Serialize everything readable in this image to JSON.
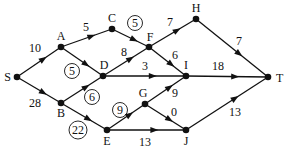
{
  "nodes": [
    {
      "id": "S",
      "label": "S"
    },
    {
      "id": "A",
      "label": "A"
    },
    {
      "id": "B",
      "label": "B"
    },
    {
      "id": "C",
      "label": "C"
    },
    {
      "id": "D",
      "label": "D"
    },
    {
      "id": "E",
      "label": "E"
    },
    {
      "id": "F",
      "label": "F"
    },
    {
      "id": "G",
      "label": "G"
    },
    {
      "id": "H",
      "label": "H"
    },
    {
      "id": "I",
      "label": "I"
    },
    {
      "id": "J",
      "label": "J"
    },
    {
      "id": "T",
      "label": "T"
    }
  ],
  "edges": [
    {
      "from": "S",
      "to": "A",
      "label": "10",
      "circled": false
    },
    {
      "from": "S",
      "to": "B",
      "label": "28",
      "circled": false
    },
    {
      "from": "A",
      "to": "C",
      "label": "5",
      "circled": false
    },
    {
      "from": "A",
      "to": "D",
      "label": "5",
      "circled": true
    },
    {
      "from": "C",
      "to": "F",
      "label": "5",
      "circled": true
    },
    {
      "from": "D",
      "to": "F",
      "label": "8",
      "circled": false
    },
    {
      "from": "D",
      "to": "I",
      "label": "3",
      "circled": false
    },
    {
      "from": "F",
      "to": "H",
      "label": "7",
      "circled": false
    },
    {
      "from": "F",
      "to": "I",
      "label": "6",
      "circled": false
    },
    {
      "from": "H",
      "to": "T",
      "label": "7",
      "circled": false
    },
    {
      "from": "I",
      "to": "T",
      "label": "18",
      "circled": false
    },
    {
      "from": "B",
      "to": "D",
      "label": "6",
      "circled": true
    },
    {
      "from": "B",
      "to": "E",
      "label": "22",
      "circled": true
    },
    {
      "from": "E",
      "to": "G",
      "label": "9",
      "circled": true
    },
    {
      "from": "G",
      "to": "I",
      "label": "9",
      "circled": false
    },
    {
      "from": "G",
      "to": "J",
      "label": "0",
      "circled": false
    },
    {
      "from": "E",
      "to": "J",
      "label": "13",
      "circled": false
    },
    {
      "from": "J",
      "to": "T",
      "label": "13",
      "circled": false
    }
  ]
}
